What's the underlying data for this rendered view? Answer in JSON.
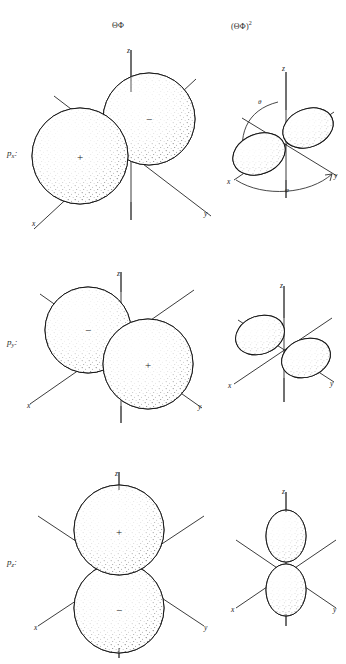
{
  "figure": {
    "background_color": "#ffffff",
    "ink_color": "#1a1a1a"
  },
  "columns": [
    {
      "id": "angular-function",
      "label": "ΘΦ"
    },
    {
      "id": "angular-function-squared",
      "label": "(ΘΦ)",
      "exponent": "2"
    }
  ],
  "rows": [
    {
      "id": "px",
      "label_base": "p",
      "label_sub": "x",
      "label_suffix": ":",
      "wavefunction": {
        "axis_labels": {
          "x": "x",
          "y": "y",
          "z": "z"
        },
        "lobes": [
          {
            "sign": "+",
            "direction": "toward +x (lower-left front)"
          },
          {
            "sign": "−",
            "direction": "toward −x (upper-right back)"
          }
        ],
        "shape": "two tangent spheres"
      },
      "squared": {
        "axis_labels": {
          "x": "x",
          "y": "y",
          "z": "z"
        },
        "angle_labels": {
          "theta": "θ",
          "phi": "φ"
        },
        "lobes": [
          {
            "sign": "",
            "direction": "toward +x (lower-left front)"
          },
          {
            "sign": "",
            "direction": "toward −x (upper-right back)"
          }
        ],
        "shape": "two tangent ellipsoids"
      }
    },
    {
      "id": "py",
      "label_base": "p",
      "label_sub": "y",
      "label_suffix": ":",
      "wavefunction": {
        "axis_labels": {
          "x": "x",
          "y": "y",
          "z": "z"
        },
        "lobes": [
          {
            "sign": "−",
            "direction": "toward −y (upper-left back)"
          },
          {
            "sign": "+",
            "direction": "toward +y (lower-right front)"
          }
        ],
        "shape": "two tangent spheres"
      },
      "squared": {
        "axis_labels": {
          "x": "x",
          "y": "y",
          "z": "z"
        },
        "angle_labels": {
          "theta": "",
          "phi": ""
        },
        "lobes": [
          {
            "sign": "",
            "direction": "toward −y (upper-left)"
          },
          {
            "sign": "",
            "direction": "toward +y (lower-right)"
          }
        ],
        "shape": "two tangent ellipsoids"
      }
    },
    {
      "id": "pz",
      "label_base": "p",
      "label_sub": "z",
      "label_suffix": ":",
      "wavefunction": {
        "axis_labels": {
          "x": "x",
          "y": "y",
          "z": "z"
        },
        "lobes": [
          {
            "sign": "+",
            "direction": "toward +z (up)"
          },
          {
            "sign": "−",
            "direction": "toward −z (down)"
          }
        ],
        "shape": "two tangent spheres"
      },
      "squared": {
        "axis_labels": {
          "x": "x",
          "y": "y",
          "z": "z"
        },
        "angle_labels": {
          "theta": "",
          "phi": ""
        },
        "lobes": [
          {
            "sign": "",
            "direction": "toward +z (up)"
          },
          {
            "sign": "",
            "direction": "toward −z (down)"
          }
        ],
        "shape": "two tangent ellipsoids"
      }
    }
  ]
}
